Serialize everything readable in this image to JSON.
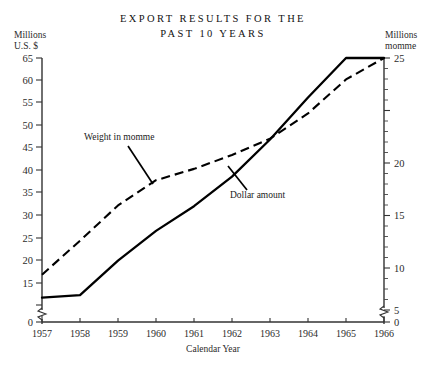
{
  "chart_data": {
    "type": "line",
    "title": "EXPORT RESULTS FOR THE",
    "title_line2": "PAST 10 YEARS",
    "xlabel": "Calendar Year",
    "ylabel_left_line1": "Millions",
    "ylabel_left_line2": "U.S. $",
    "ylabel_right_line1": "Millions",
    "ylabel_right_line2": "momme",
    "categories": [
      1957,
      1958,
      1959,
      1960,
      1961,
      1962,
      1963,
      1964,
      1965,
      1966
    ],
    "xlim": [
      1957,
      1966
    ],
    "grid": false,
    "legend_position": "inline-annotations",
    "left_axis": {
      "ticks": [
        0,
        15,
        20,
        25,
        30,
        35,
        40,
        45,
        50,
        55,
        60,
        65
      ],
      "tick_labels": [
        "0",
        "15",
        "20",
        "25",
        "30",
        "35",
        "40",
        "45",
        "50",
        "55",
        "60",
        "65"
      ],
      "ylim": [
        15,
        65
      ],
      "axis_break": true,
      "units": "Millions U.S. $"
    },
    "right_axis": {
      "ticks": [
        0,
        5,
        10,
        15,
        20,
        25
      ],
      "tick_labels": [
        "0",
        "5",
        "10",
        "15",
        "20",
        "25"
      ],
      "ylim": [
        5,
        25
      ],
      "minor_tick_step": 1,
      "axis_break": true,
      "units": "Millions momme"
    },
    "series": [
      {
        "name": "Dollar amount",
        "style": "solid",
        "axis": "left",
        "annotation": "Dollar amount",
        "values": [
          16.5,
          17.0,
          24.0,
          30.0,
          35.0,
          41.0,
          48.5,
          57.0,
          65.0,
          65.0
        ]
      },
      {
        "name": "Weight in momme",
        "style": "dashed",
        "axis": "right",
        "annotation": "Weight in momme",
        "values": [
          7.8,
          10.5,
          13.3,
          15.3,
          16.2,
          17.3,
          18.6,
          20.6,
          23.3,
          25.0
        ]
      }
    ],
    "annotations": [
      {
        "text": "Weight in momme",
        "target_year": 1960
      },
      {
        "text": "Dollar amount",
        "target_year": 1963
      }
    ]
  }
}
